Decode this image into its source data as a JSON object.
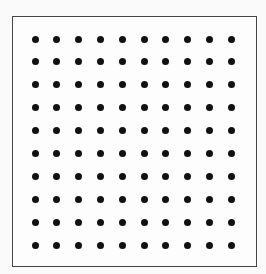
{
  "diagram": {
    "type": "dot-grid",
    "rows": 10,
    "columns": 10,
    "dot_color": "#111111",
    "border_color": "#444444",
    "background_color": "#fafafa",
    "dot_diameter_px": 7,
    "grid_origin_px": [
      35,
      39
    ],
    "spacing_px": [
      21.8,
      22.9
    ]
  }
}
